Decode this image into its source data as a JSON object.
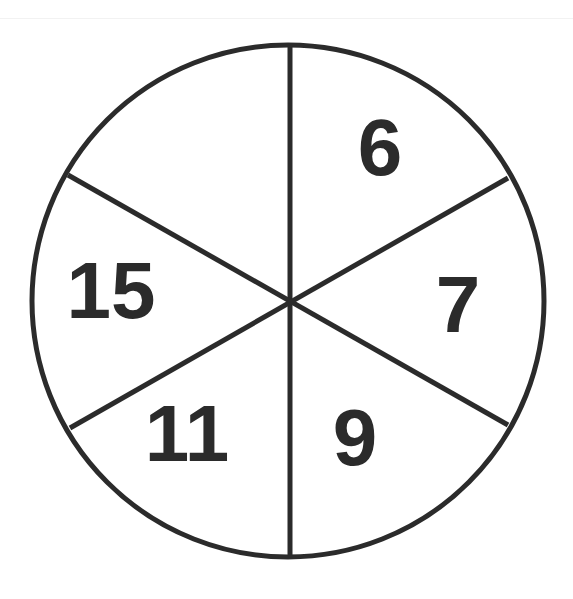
{
  "diagram": {
    "type": "circle-divided-into-sectors",
    "sector_count": 6,
    "stroke_color": "#2b2b2b",
    "text_color": "#2b2b2b",
    "sectors": [
      {
        "position": "top-right",
        "value": "6"
      },
      {
        "position": "right",
        "value": "7"
      },
      {
        "position": "bottom-right",
        "value": "9"
      },
      {
        "position": "bottom-left",
        "value": "11"
      },
      {
        "position": "left",
        "value": "15"
      },
      {
        "position": "top-left",
        "value": ""
      }
    ]
  }
}
